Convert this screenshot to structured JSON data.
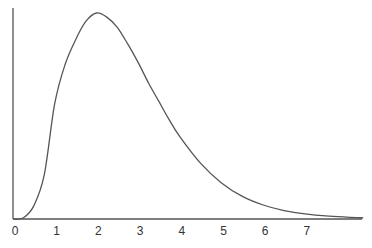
{
  "chart_data": {
    "type": "line",
    "title": "",
    "xlabel": "",
    "ylabel": "",
    "x_ticks": [
      "0",
      "1",
      "2",
      "3",
      "4",
      "5",
      "6",
      "7"
    ],
    "xlim": [
      0,
      8.4
    ],
    "ylim": [
      0,
      1.0
    ],
    "grid": false,
    "legend": null,
    "series": [
      {
        "name": "density",
        "x": [
          0,
          0.25,
          0.5,
          0.75,
          1,
          1.25,
          1.5,
          1.75,
          2,
          2.25,
          2.5,
          2.75,
          3,
          3.25,
          3.5,
          3.75,
          4,
          4.5,
          5,
          5.5,
          6,
          6.5,
          7,
          7.5,
          8,
          8.4
        ],
        "y": [
          0,
          0.006,
          0.065,
          0.215,
          0.56,
          0.75,
          0.87,
          0.96,
          1.0,
          0.98,
          0.93,
          0.85,
          0.76,
          0.66,
          0.57,
          0.48,
          0.4,
          0.27,
          0.175,
          0.11,
          0.068,
          0.041,
          0.025,
          0.015,
          0.009,
          0.006
        ]
      }
    ]
  },
  "colors": {
    "axis": "#555555",
    "curve": "#555555",
    "background": "#ffffff"
  }
}
